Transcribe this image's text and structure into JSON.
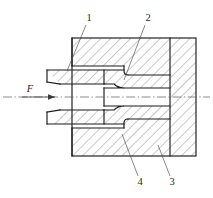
{
  "figure": {
    "type": "engineering-cross-section",
    "background_color": "#ffffff",
    "line_color": "#1a1a1a",
    "hatch_color": "#555555",
    "centerline_color": "#5a5a5a"
  },
  "force": {
    "symbol": "F",
    "direction": "right",
    "x": 30,
    "y": 90
  },
  "callouts": [
    {
      "id": "1",
      "label": "1",
      "text_x": 89,
      "text_y": 19,
      "leader_x1": 86,
      "leader_y1": 25,
      "leader_x2": 67,
      "leader_y2": 71
    },
    {
      "id": "2",
      "label": "2",
      "text_x": 148,
      "text_y": 19,
      "leader_x1": 145,
      "leader_y1": 25,
      "leader_x2": 124,
      "leader_y2": 80
    },
    {
      "id": "3",
      "label": "3",
      "text_x": 172,
      "text_y": 183,
      "leader_x1": 170,
      "leader_y1": 176,
      "leader_x2": 158,
      "leader_y2": 145
    },
    {
      "id": "4",
      "label": "4",
      "text_x": 140,
      "text_y": 183,
      "leader_x1": 138,
      "leader_y1": 176,
      "leader_x2": 122,
      "leader_y2": 134
    }
  ],
  "geometry": {
    "body_left": 72,
    "body_right": 196,
    "body_top": 38,
    "body_bottom": 156,
    "inner_wall_x": 170,
    "centerline_y": 97,
    "sleeve_left": 47,
    "sleeve_top": 66,
    "sleeve_bottom": 128,
    "cavity_right": 170,
    "bore_half_height": 9
  }
}
